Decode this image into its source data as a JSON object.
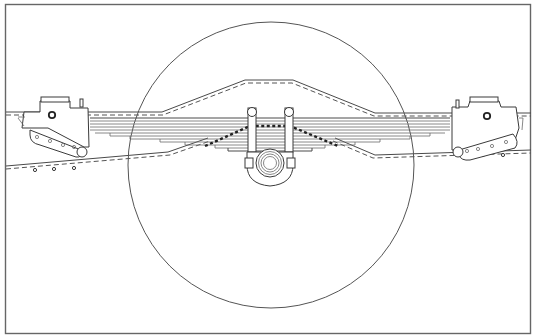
{
  "diagram": {
    "title": "Leaf spring rear suspension – side elevation",
    "colors": {
      "background": "#ffffff",
      "line": "#4a4a4a",
      "frame_border": "#666666",
      "dark_leaf_dashes": "#222222"
    },
    "components": [
      {
        "id": "frame-border",
        "label": "Drawing border"
      },
      {
        "id": "wheel-outline",
        "label": "Wheel outline circle"
      },
      {
        "id": "frame-rail-upper",
        "label": "Chassis frame rail (upper edge, kicked up over axle)"
      },
      {
        "id": "frame-rail-lower",
        "label": "Chassis frame rail (lower edge)"
      },
      {
        "id": "leaf-spring-pack",
        "label": "Multi-leaf spring pack"
      },
      {
        "id": "u-bolts",
        "label": "U-bolts (2)"
      },
      {
        "id": "axle-housing",
        "label": "Axle housing (circular section)"
      },
      {
        "id": "front-hanger",
        "label": "Front spring hanger bracket"
      },
      {
        "id": "rear-hanger",
        "label": "Rear spring hanger bracket"
      }
    ],
    "geometry": {
      "border": {
        "x": 5,
        "y": 4,
        "w": 526,
        "h": 330
      },
      "wheel": {
        "cx": 271,
        "cy": 165,
        "r": 143
      },
      "axle": {
        "cx": 270,
        "cy": 162,
        "r_outer": 14
      },
      "leaf_count": 8
    }
  }
}
